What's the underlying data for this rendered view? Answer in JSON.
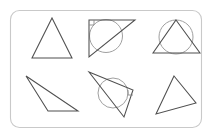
{
  "panel": {
    "name": "geometry-figure-panel",
    "border_color": "#c9c9c9",
    "background_color": "#ffffff",
    "corner_radius": 9,
    "x": 10,
    "y": 10,
    "width": 192,
    "height": 118
  },
  "style": {
    "triangle_stroke": "#4f4f4f",
    "circle_stroke": "#a0a0a0",
    "right_angle_stroke": "#8a8a8a",
    "triangle_stroke_width": 1.05,
    "circle_stroke_width": 1.0
  },
  "chart_data": {
    "type": "diagram",
    "title": "",
    "grid": false,
    "legend": null,
    "xlim": [
      0,
      213
    ],
    "ylim": [
      0,
      137
    ],
    "shape_count": 6,
    "circle_count": 3,
    "right_angle_marker_count": 2,
    "shapes": [
      {
        "id": "shape-1",
        "label": "isosceles-triangle",
        "cell": "top-left",
        "has_circle": false,
        "has_right_angle_marker": false,
        "points": "52,18 72,58 32,58"
      },
      {
        "id": "shape-2",
        "label": "right-triangle-with-circle",
        "cell": "top-center",
        "has_circle": true,
        "has_right_angle_marker": true,
        "points": "89,20 135,20 89,57",
        "circle": {
          "cx": 106,
          "cy": 36,
          "r": 16.5
        },
        "right_angle": {
          "x": 89,
          "y": 20,
          "size": 5,
          "dir_x": 1,
          "dir_y": 1
        }
      },
      {
        "id": "shape-3",
        "label": "triangle-with-circumscribed-circle",
        "cell": "top-right",
        "has_circle": true,
        "has_right_angle_marker": false,
        "points": "176,20 200,53 153,53",
        "circle": {
          "cx": 176,
          "cy": 37,
          "r": 17
        }
      },
      {
        "id": "shape-4",
        "label": "obtuse-scalene-triangle",
        "cell": "bottom-left",
        "has_circle": false,
        "has_right_angle_marker": false,
        "points": "26,76 78,111 48,111"
      },
      {
        "id": "shape-5",
        "label": "scalene-triangle-with-circle",
        "cell": "bottom-center",
        "has_circle": true,
        "has_right_angle_marker": true,
        "points": "89,72 133,90 124,117",
        "circle": {
          "cx": 113,
          "cy": 93,
          "r": 15
        },
        "right_angle": {
          "x": 133,
          "y": 90,
          "size": 5,
          "dir_x": -1,
          "dir_y": 1
        }
      },
      {
        "id": "shape-6",
        "label": "tilted-scalene-triangle",
        "cell": "bottom-right",
        "has_circle": false,
        "has_right_angle_marker": false,
        "points": "174,76 196,103 156,114"
      }
    ]
  }
}
